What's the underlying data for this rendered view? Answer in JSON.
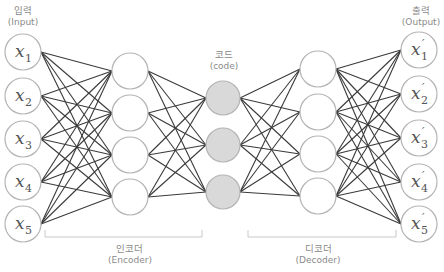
{
  "diagram": {
    "colors": {
      "edge": "#3a3a3a",
      "node_stroke": "#b4b4b4",
      "node_fill": "#ffffff",
      "code_fill": "#d9d9d9",
      "label": "#8a8a8a",
      "bracket": "#c8c8c8"
    },
    "labels": {
      "input": {
        "ko": "입력",
        "en": "(Input)",
        "x": 23,
        "y": 6
      },
      "output": {
        "ko": "출력",
        "en": "(Output)",
        "x": 421,
        "y": 6
      },
      "code": {
        "ko": "코드",
        "en": "(code)",
        "x": 224,
        "y": 50
      },
      "encoder": {
        "ko": "인코더",
        "en": "(Encoder)",
        "x": 130,
        "y": 244
      },
      "decoder": {
        "ko": "디코더",
        "en": "(Decoder)",
        "x": 318,
        "y": 244
      }
    },
    "layers": [
      {
        "name": "input",
        "x": 23,
        "r": 18,
        "fill": "node_fill",
        "nodes": [
          {
            "y": 52,
            "label": "x",
            "sub": "1",
            "prime": false
          },
          {
            "y": 96,
            "label": "x",
            "sub": "2",
            "prime": false
          },
          {
            "y": 139,
            "label": "x",
            "sub": "3",
            "prime": false
          },
          {
            "y": 182,
            "label": "x",
            "sub": "4",
            "prime": false
          },
          {
            "y": 224,
            "label": "x",
            "sub": "5",
            "prime": false
          }
        ]
      },
      {
        "name": "encoder-hidden",
        "x": 130,
        "r": 18,
        "fill": "node_fill",
        "nodes": [
          {
            "y": 71
          },
          {
            "y": 113
          },
          {
            "y": 155
          },
          {
            "y": 197
          }
        ]
      },
      {
        "name": "code",
        "x": 223,
        "r": 17,
        "fill": "code_fill",
        "nodes": [
          {
            "y": 98
          },
          {
            "y": 145
          },
          {
            "y": 192
          }
        ]
      },
      {
        "name": "decoder-hidden",
        "x": 318,
        "r": 18,
        "fill": "node_fill",
        "nodes": [
          {
            "y": 69
          },
          {
            "y": 112
          },
          {
            "y": 154
          },
          {
            "y": 196
          }
        ]
      },
      {
        "name": "output",
        "x": 419,
        "r": 18,
        "fill": "node_fill",
        "nodes": [
          {
            "y": 50,
            "label": "x",
            "sub": "1",
            "prime": true
          },
          {
            "y": 94,
            "label": "x",
            "sub": "2",
            "prime": true
          },
          {
            "y": 138,
            "label": "x",
            "sub": "3",
            "prime": true
          },
          {
            "y": 182,
            "label": "x",
            "sub": "4",
            "prime": true
          },
          {
            "y": 224,
            "label": "x",
            "sub": "5",
            "prime": true
          }
        ]
      }
    ],
    "brackets": [
      {
        "name": "encoder",
        "x1": 45,
        "x2": 202,
        "y": 237,
        "tick": 7
      },
      {
        "name": "decoder",
        "x1": 248,
        "x2": 396,
        "y": 237,
        "tick": 7
      }
    ]
  }
}
